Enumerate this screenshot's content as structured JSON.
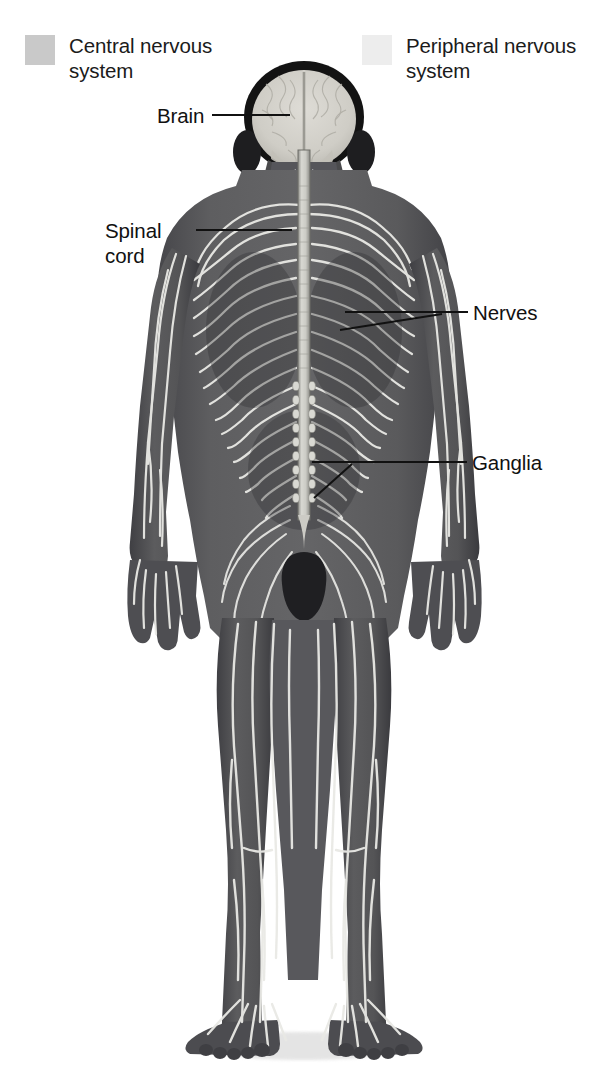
{
  "diagram": {
    "background_color": "#ffffff"
  },
  "legend": {
    "items": [
      {
        "key": "central",
        "label": "Central nervous\nsystem",
        "swatch_color": "#c9c9c9"
      },
      {
        "key": "peripheral",
        "label": "Peripheral nervous\nsystem",
        "swatch_color": "#ededed"
      }
    ]
  },
  "callouts": [
    {
      "key": "brain",
      "label": "Brain",
      "system": "central"
    },
    {
      "key": "spinal_cord",
      "label": "Spinal\ncord",
      "system": "central"
    },
    {
      "key": "nerves",
      "label": "Nerves",
      "system": "peripheral"
    },
    {
      "key": "ganglia",
      "label": "Ganglia",
      "system": "peripheral"
    }
  ],
  "anatomy": {
    "body_fill": "#58585a",
    "body_shadow": "#3a3a3c",
    "nerve_color": "#e8e8e4",
    "brain_color": "#d2d2cc",
    "hair_color": "#141414",
    "cord_color": "#c6c6c2",
    "leader_color": "#111111"
  }
}
